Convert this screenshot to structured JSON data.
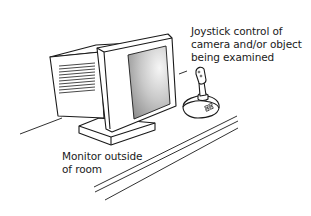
{
  "diagram": {
    "labels": {
      "joystick": "Joystick control of\ncamera and/or object\nbeing examined",
      "monitor": "Monitor outside\nof room"
    },
    "elements": [
      {
        "name": "crt-monitor",
        "icon": "monitor-icon"
      },
      {
        "name": "joystick",
        "icon": "joystick-icon"
      },
      {
        "name": "desk-surface",
        "icon": "desk-lines"
      }
    ],
    "colors": {
      "stroke": "#1a1a1a",
      "fill": "#ffffff",
      "screen_light": "#f4f4f4",
      "screen_dark": "#9a9a9a"
    }
  }
}
